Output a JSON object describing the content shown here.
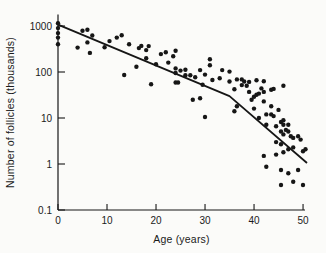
{
  "figure": {
    "background": "#fbfbf9",
    "ink_color": "#161616"
  },
  "chart_data": {
    "type": "scatter",
    "title": "",
    "xlabel": "Age (years)",
    "ylabel": "Number of follicles (thousands)",
    "y_scale": "log",
    "grid": false,
    "legend": false,
    "xlim": [
      0,
      51.5
    ],
    "ylim": [
      0.1,
      1780
    ],
    "ylim_log": [
      -1,
      3.25
    ],
    "x_ticks": [
      0,
      10,
      20,
      30,
      40,
      50
    ],
    "x_tick_labels": [
      "0",
      "10",
      "20",
      "30",
      "40",
      "50"
    ],
    "y_ticks": [
      1000,
      100,
      10,
      1,
      0.1
    ],
    "y_tick_labels": [
      "1000",
      "100",
      "10",
      "1",
      "0.1"
    ],
    "point_color": "#161616",
    "line_color": "#161616",
    "points": [
      [
        0,
        1150
      ],
      [
        0,
        900
      ],
      [
        0,
        700
      ],
      [
        0,
        560
      ],
      [
        0,
        400
      ],
      [
        4,
        340
      ],
      [
        5,
        790
      ],
      [
        6,
        830
      ],
      [
        6,
        440
      ],
      [
        6.5,
        260
      ],
      [
        7,
        620
      ],
      [
        9.5,
        345
      ],
      [
        10.5,
        470
      ],
      [
        12,
        560
      ],
      [
        13,
        630
      ],
      [
        13.5,
        86
      ],
      [
        14.5,
        400
      ],
      [
        16,
        130
      ],
      [
        16.5,
        330
      ],
      [
        17,
        370
      ],
      [
        18,
        300
      ],
      [
        18,
        200
      ],
      [
        18.5,
        365
      ],
      [
        19,
        54
      ],
      [
        20,
        148
      ],
      [
        21,
        245
      ],
      [
        22,
        270
      ],
      [
        22.5,
        160
      ],
      [
        23.5,
        220
      ],
      [
        24,
        290
      ],
      [
        24,
        120
      ],
      [
        24,
        95
      ],
      [
        24,
        59
      ],
      [
        24.5,
        59
      ],
      [
        25,
        107
      ],
      [
        26,
        112
      ],
      [
        26,
        85
      ],
      [
        27,
        85
      ],
      [
        27.5,
        25
      ],
      [
        28,
        77
      ],
      [
        29,
        27
      ],
      [
        29,
        110
      ],
      [
        29.5,
        53
      ],
      [
        30,
        88
      ],
      [
        30,
        10.5
      ],
      [
        31,
        140
      ],
      [
        31,
        190
      ],
      [
        31.5,
        67
      ],
      [
        33,
        73
      ],
      [
        33.5,
        110
      ],
      [
        35,
        102
      ],
      [
        35,
        62
      ],
      [
        36,
        42
      ],
      [
        36,
        14
      ],
      [
        36.5,
        18
      ],
      [
        36.5,
        69
      ],
      [
        37.5,
        69
      ],
      [
        37.5,
        52
      ],
      [
        38,
        62
      ],
      [
        38.5,
        50
      ],
      [
        39,
        61
      ],
      [
        39,
        37
      ],
      [
        39.5,
        25
      ],
      [
        40,
        29
      ],
      [
        40,
        16
      ],
      [
        40.5,
        32
      ],
      [
        40.5,
        66
      ],
      [
        41,
        34
      ],
      [
        41,
        10
      ],
      [
        41.5,
        44
      ],
      [
        42,
        63
      ],
      [
        42,
        37
      ],
      [
        42,
        23
      ],
      [
        42,
        1.5
      ],
      [
        42.5,
        12
      ],
      [
        42.5,
        7.1
      ],
      [
        42.5,
        0.87
      ],
      [
        43.5,
        41
      ],
      [
        43.5,
        18
      ],
      [
        43.5,
        12
      ],
      [
        44,
        43
      ],
      [
        44,
        11
      ],
      [
        44.5,
        6.6
      ],
      [
        44.5,
        3
      ],
      [
        44.5,
        1.6
      ],
      [
        45,
        15
      ],
      [
        45.5,
        8.2
      ],
      [
        45.5,
        5.1
      ],
      [
        45.5,
        2.7
      ],
      [
        45.5,
        0.74
      ],
      [
        45.5,
        0.35
      ],
      [
        46,
        50
      ],
      [
        46,
        8.9
      ],
      [
        46,
        7.1
      ],
      [
        46,
        4.4
      ],
      [
        46,
        1.8
      ],
      [
        46.5,
        5.5
      ],
      [
        47,
        7.1
      ],
      [
        47,
        5.1
      ],
      [
        47,
        2.1
      ],
      [
        47,
        0.63
      ],
      [
        47.5,
        4
      ],
      [
        48,
        3.7
      ],
      [
        48,
        2.3
      ],
      [
        48,
        0.41
      ],
      [
        49,
        4
      ],
      [
        49,
        0.74
      ],
      [
        49.5,
        3.4
      ],
      [
        50,
        1.9
      ],
      [
        50,
        0.35
      ],
      [
        50.5,
        2.1
      ]
    ],
    "trend_line": [
      [
        0,
        1070
      ],
      [
        35,
        30
      ],
      [
        50.8,
        1.05
      ]
    ]
  }
}
